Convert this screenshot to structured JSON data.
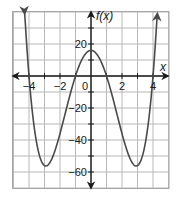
{
  "chart_data": {
    "type": "line",
    "title": "",
    "xlabel": "x",
    "ylabel": "f(x)",
    "xlim": [
      -5,
      5
    ],
    "ylim": [
      -70,
      40
    ],
    "grid": true,
    "x_grid_step": 1,
    "y_grid_step": 10,
    "x_tick_labels": [
      "-4",
      "-2",
      "0",
      "2",
      "4"
    ],
    "x_tick_values": [
      -4,
      -2,
      0,
      2,
      4
    ],
    "y_tick_labels": [
      "20",
      "-20",
      "-40",
      "-60"
    ],
    "y_tick_values": [
      20,
      -20,
      -40,
      -60
    ],
    "series": [
      {
        "name": "f(x)",
        "description": "quartic polynomial, approx f(x) = (x^2 - 1)(x^2 - 16)",
        "color": "#555555",
        "x": [
          -4.3,
          -4.0,
          -3.5,
          -3.0,
          -2.5,
          -2.0,
          -1.5,
          -1.0,
          -0.5,
          0.0,
          0.5,
          1.0,
          1.5,
          2.0,
          2.5,
          3.0,
          3.5,
          4.0,
          4.3
        ],
        "y": [
          24.3,
          0,
          -35.2,
          -56.0,
          -51.2,
          -36.0,
          -17.9,
          0,
          11.8,
          16,
          11.8,
          0,
          -17.9,
          -36.0,
          -51.2,
          -56.0,
          -35.2,
          0,
          24.3
        ]
      }
    ],
    "key_points": {
      "local_max": [
        0,
        16
      ],
      "local_mins": [
        [
          -2.9,
          -56
        ],
        [
          2.9,
          -56
        ]
      ],
      "roots": [
        -4,
        -1,
        1,
        4
      ]
    }
  },
  "labels": {
    "x_axis": "x",
    "y_axis": "f(x)",
    "origin": "0"
  },
  "colors": {
    "grid": "#b8b8b8",
    "axis": "#1a1a1a",
    "curve": "#4a4a4a",
    "background": "#ffffff"
  }
}
